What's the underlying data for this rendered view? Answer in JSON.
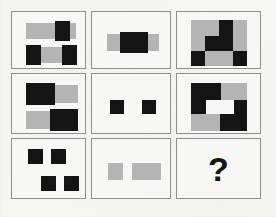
{
  "puzzle": {
    "type": "visual-analogy-matrix",
    "rows": 3,
    "columns": 3,
    "question_mark": "?",
    "colors": {
      "black": "#141414",
      "gray": "#b4b4b4",
      "panel_background": "#f7f7f6",
      "panel_border": "#8f8f8f",
      "page_background": "#f6f6f5"
    },
    "cells": [
      {
        "id": "cell-r1c1",
        "row": 1,
        "column": 1,
        "label": "two-bars-with-black-blocks",
        "shapes": [
          {
            "name": "gray-bar-top",
            "color": "gray",
            "x": 14,
            "y": 11,
            "w": 50,
            "h": 16
          },
          {
            "name": "black-block-top",
            "color": "black",
            "x": 43,
            "y": 9,
            "w": 15,
            "h": 20
          },
          {
            "name": "gray-bar-bottom",
            "color": "gray",
            "x": 14,
            "y": 35,
            "w": 50,
            "h": 16
          },
          {
            "name": "black-block-bottom-left",
            "color": "black",
            "x": 14,
            "y": 33,
            "w": 15,
            "h": 20
          },
          {
            "name": "black-block-bottom-right",
            "color": "black",
            "x": 50,
            "y": 33,
            "w": 15,
            "h": 20
          }
        ]
      },
      {
        "id": "cell-r1c2",
        "row": 1,
        "column": 2,
        "label": "single-gray-bar-with-centered-black-block",
        "shapes": [
          {
            "name": "gray-bar",
            "color": "gray",
            "x": 15,
            "y": 22,
            "w": 52,
            "h": 17
          },
          {
            "name": "black-center",
            "color": "black",
            "x": 28,
            "y": 20,
            "w": 28,
            "h": 21
          }
        ]
      },
      {
        "id": "cell-r1c3",
        "row": 1,
        "column": 3,
        "label": "gray-square-with-black-staircase",
        "shapes": [
          {
            "name": "gray-square-base",
            "color": "gray",
            "x": 14,
            "y": 8,
            "w": 56,
            "h": 46
          },
          {
            "name": "black-step-upper",
            "color": "black",
            "x": 42,
            "y": 8,
            "w": 14,
            "h": 16
          },
          {
            "name": "black-step-middle",
            "color": "black",
            "x": 28,
            "y": 24,
            "w": 28,
            "h": 15
          },
          {
            "name": "black-corner-left",
            "color": "black",
            "x": 14,
            "y": 39,
            "w": 14,
            "h": 15
          },
          {
            "name": "black-corner-right",
            "color": "black",
            "x": 56,
            "y": 39,
            "w": 14,
            "h": 15
          }
        ]
      },
      {
        "id": "cell-r2c1",
        "row": 2,
        "column": 1,
        "label": "two-half-black-half-gray-bars",
        "shapes": [
          {
            "name": "gray-bar-top",
            "color": "gray",
            "x": 14,
            "y": 11,
            "w": 52,
            "h": 18
          },
          {
            "name": "black-half-top-left",
            "color": "black",
            "x": 14,
            "y": 9,
            "w": 29,
            "h": 22
          },
          {
            "name": "gray-bar-bottom",
            "color": "gray",
            "x": 14,
            "y": 37,
            "w": 52,
            "h": 18
          },
          {
            "name": "black-half-bottom-right",
            "color": "black",
            "x": 38,
            "y": 35,
            "w": 28,
            "h": 22
          }
        ]
      },
      {
        "id": "cell-r2c2",
        "row": 2,
        "column": 2,
        "label": "two-small-black-squares",
        "shapes": [
          {
            "name": "black-square-left",
            "color": "black",
            "x": 18,
            "y": 26,
            "w": 14,
            "h": 14
          },
          {
            "name": "black-square-right",
            "color": "black",
            "x": 50,
            "y": 26,
            "w": 14,
            "h": 14
          }
        ]
      },
      {
        "id": "cell-r2c3",
        "row": 2,
        "column": 3,
        "label": "gray-square-with-black-zigzag",
        "shapes": [
          {
            "name": "gray-square-base",
            "color": "gray",
            "x": 14,
            "y": 9,
            "w": 56,
            "h": 48
          },
          {
            "name": "black-top-left-block",
            "color": "black",
            "x": 14,
            "y": 9,
            "w": 30,
            "h": 17
          },
          {
            "name": "black-left-column",
            "color": "black",
            "x": 14,
            "y": 26,
            "w": 15,
            "h": 14
          },
          {
            "name": "white-notch-middle",
            "color": "white",
            "x": 29,
            "y": 26,
            "w": 28,
            "h": 14
          },
          {
            "name": "black-right-block",
            "color": "black",
            "x": 57,
            "y": 26,
            "w": 13,
            "h": 14
          },
          {
            "name": "black-bottom-right",
            "color": "black",
            "x": 43,
            "y": 40,
            "w": 27,
            "h": 17
          }
        ]
      },
      {
        "id": "cell-r3c1",
        "row": 3,
        "column": 1,
        "label": "four-black-squares-offset",
        "shapes": [
          {
            "name": "black-square-top-left",
            "color": "black",
            "x": 16,
            "y": 10,
            "w": 15,
            "h": 15
          },
          {
            "name": "black-square-top-right",
            "color": "black",
            "x": 39,
            "y": 10,
            "w": 15,
            "h": 15
          },
          {
            "name": "black-square-bottom-left",
            "color": "black",
            "x": 29,
            "y": 37,
            "w": 15,
            "h": 15
          },
          {
            "name": "black-square-bottom-right",
            "color": "black",
            "x": 52,
            "y": 37,
            "w": 15,
            "h": 15
          }
        ]
      },
      {
        "id": "cell-r3c2",
        "row": 3,
        "column": 2,
        "label": "gray-square-and-gray-rectangle",
        "shapes": [
          {
            "name": "gray-square",
            "color": "gray",
            "x": 16,
            "y": 24,
            "w": 15,
            "h": 17
          },
          {
            "name": "gray-rectangle",
            "color": "gray",
            "x": 40,
            "y": 24,
            "w": 29,
            "h": 17
          }
        ]
      },
      {
        "id": "cell-r3c3",
        "row": 3,
        "column": 3,
        "label": "answer-placeholder",
        "is_question": true,
        "shapes": []
      }
    ]
  }
}
